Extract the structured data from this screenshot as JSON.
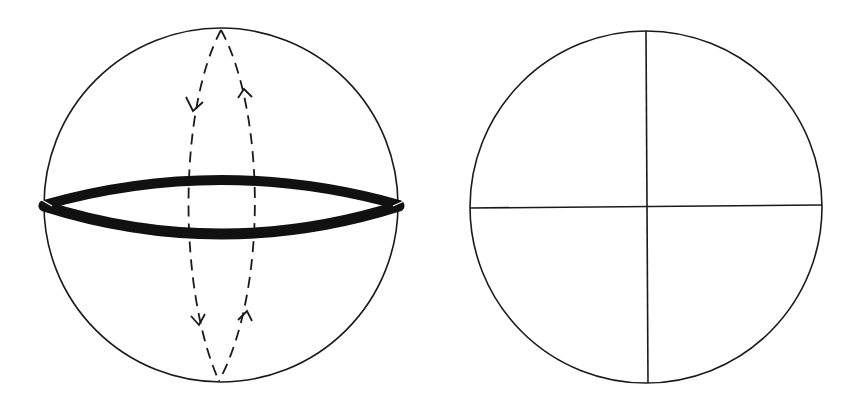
{
  "figure": {
    "background": "#ffffff",
    "stroke_color": "#1a1a1a",
    "panels": [
      {
        "id": "left",
        "description": "Sphere with thick equatorial band and dashed meridian loop with direction arrows",
        "circle": {
          "cx": 221,
          "cy": 205,
          "r": 177
        },
        "equator_band": {
          "left_x": 44,
          "right_x": 399,
          "y": 205,
          "upper_bulge": 22,
          "lower_bulge": 32,
          "width": 10
        },
        "meridian_loop": {
          "top": [
            221,
            30
          ],
          "bottom": [
            219,
            381
          ],
          "left_ctrl_x": 182,
          "right_ctrl_x": 268,
          "dashed": true,
          "arrows": [
            {
              "position": "upper-left",
              "direction": "down"
            },
            {
              "position": "upper-right",
              "direction": "up"
            },
            {
              "position": "lower-left",
              "direction": "down"
            },
            {
              "position": "lower-right",
              "direction": "up"
            }
          ]
        }
      },
      {
        "id": "right",
        "description": "Circle divided into four quadrants by vertical and horizontal lines",
        "circle": {
          "cx": 646,
          "cy": 207,
          "r": 176
        },
        "vertical_line": {
          "x1": 646,
          "y1": 31,
          "x2": 648,
          "y2": 383
        },
        "horizontal_line": {
          "x1": 470,
          "y1": 208,
          "x2": 822,
          "y2": 205
        }
      }
    ]
  }
}
